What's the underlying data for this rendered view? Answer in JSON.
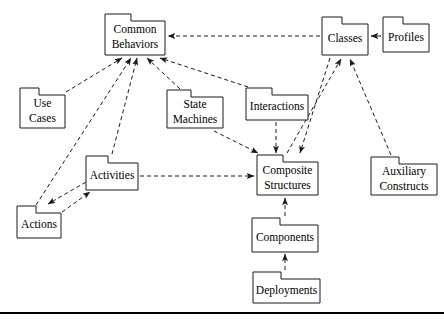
{
  "diagram": {
    "type": "uml-package-diagram",
    "width": 444,
    "height": 326,
    "background_color": "#ffffff",
    "line_color": "#1a1a1a",
    "packages": [
      {
        "id": "common-behaviors",
        "label": "Common\nBehaviors",
        "line1": "Common",
        "line2": "Behaviors",
        "x": 105,
        "y": 14,
        "w": 60,
        "h": 41,
        "tab_w": 26,
        "tab_h": 7
      },
      {
        "id": "classes",
        "label": "Classes",
        "line1": "Classes",
        "line2": "",
        "x": 322,
        "y": 17,
        "w": 46,
        "h": 38,
        "tab_w": 20,
        "tab_h": 7
      },
      {
        "id": "profiles",
        "label": "Profiles",
        "line1": "Profiles",
        "line2": "",
        "x": 383,
        "y": 17,
        "w": 46,
        "h": 35,
        "tab_w": 20,
        "tab_h": 7
      },
      {
        "id": "use-cases",
        "label": "Use\nCases",
        "line1": "Use",
        "line2": "Cases",
        "x": 20,
        "y": 88,
        "w": 45,
        "h": 40,
        "tab_w": 19,
        "tab_h": 7
      },
      {
        "id": "state-machines",
        "label": "State\nMachines",
        "line1": "State",
        "line2": "Machines",
        "x": 167,
        "y": 90,
        "w": 56,
        "h": 38,
        "tab_w": 24,
        "tab_h": 7
      },
      {
        "id": "interactions",
        "label": "Interactions",
        "line1": "Interactions",
        "line2": "",
        "x": 246,
        "y": 88,
        "w": 62,
        "h": 32,
        "tab_w": 26,
        "tab_h": 7
      },
      {
        "id": "activities",
        "label": "Activities",
        "line1": "Activities",
        "line2": "",
        "x": 86,
        "y": 156,
        "w": 52,
        "h": 34,
        "tab_w": 22,
        "tab_h": 7
      },
      {
        "id": "composite-structures",
        "label": "Composite\nStructures",
        "line1": "Composite",
        "line2": "Structures",
        "x": 257,
        "y": 155,
        "w": 61,
        "h": 40,
        "tab_w": 26,
        "tab_h": 7
      },
      {
        "id": "auxiliary-constructs",
        "label": "Auxiliary\nConstructs",
        "line1": "Auxiliary",
        "line2": "Constructs",
        "x": 371,
        "y": 157,
        "w": 66,
        "h": 38,
        "tab_w": 28,
        "tab_h": 7
      },
      {
        "id": "actions",
        "label": "Actions",
        "line1": "Actions",
        "line2": "",
        "x": 17,
        "y": 206,
        "w": 44,
        "h": 32,
        "tab_w": 19,
        "tab_h": 7
      },
      {
        "id": "components",
        "label": "Components",
        "line1": "Components",
        "line2": "",
        "x": 252,
        "y": 218,
        "w": 66,
        "h": 34,
        "tab_w": 28,
        "tab_h": 7
      },
      {
        "id": "deployments",
        "label": "Deployments",
        "line1": "Deployments",
        "line2": "",
        "x": 253,
        "y": 272,
        "w": 67,
        "h": 31,
        "tab_w": 28,
        "tab_h": 7
      }
    ],
    "dependencies": [
      {
        "from": "use-cases",
        "to": "common-behaviors",
        "x1": 66,
        "y1": 92,
        "x2": 122,
        "y2": 58
      },
      {
        "from": "actions",
        "to": "common-behaviors",
        "x1": 36,
        "y1": 205,
        "x2": 131,
        "y2": 58
      },
      {
        "from": "activities",
        "to": "common-behaviors",
        "x1": 112,
        "y1": 154,
        "x2": 137,
        "y2": 58
      },
      {
        "from": "state-machines",
        "to": "common-behaviors",
        "x1": 180,
        "y1": 89,
        "x2": 147,
        "y2": 58
      },
      {
        "from": "interactions",
        "to": "common-behaviors",
        "x1": 248,
        "y1": 87,
        "x2": 160,
        "y2": 58
      },
      {
        "from": "classes",
        "to": "common-behaviors",
        "x1": 320,
        "y1": 36,
        "x2": 168,
        "y2": 36
      },
      {
        "from": "profiles",
        "to": "classes",
        "x1": 381,
        "y1": 36,
        "x2": 371,
        "y2": 36
      },
      {
        "from": "composite-structures",
        "to": "classes",
        "x1": 287,
        "y1": 153,
        "x2": 341,
        "y2": 59
      },
      {
        "from": "auxiliary-constructs",
        "to": "classes",
        "x1": 391,
        "y1": 155,
        "x2": 350,
        "y2": 59
      },
      {
        "from": "activities",
        "to": "actions",
        "x1": 86,
        "y1": 182,
        "x2": 48,
        "y2": 204
      },
      {
        "from": "actions",
        "to": "activities",
        "x1": 62,
        "y1": 212,
        "x2": 90,
        "y2": 192
      },
      {
        "from": "activities",
        "to": "composite-structures",
        "x1": 140,
        "y1": 176,
        "x2": 254,
        "y2": 176
      },
      {
        "from": "state-machines",
        "to": "composite-structures",
        "x1": 214,
        "y1": 131,
        "x2": 258,
        "y2": 153
      },
      {
        "from": "interactions",
        "to": "composite-structures",
        "x1": 276,
        "y1": 122,
        "x2": 276,
        "y2": 153
      },
      {
        "from": "classes",
        "to": "composite-structures",
        "x1": 330,
        "y1": 58,
        "x2": 300,
        "y2": 153
      },
      {
        "from": "components",
        "to": "composite-structures",
        "x1": 285,
        "y1": 216,
        "x2": 285,
        "y2": 198
      },
      {
        "from": "deployments",
        "to": "components",
        "x1": 285,
        "y1": 270,
        "x2": 285,
        "y2": 254
      }
    ],
    "footer_rule": {
      "y": 313,
      "x1": 0,
      "x2": 444
    }
  }
}
